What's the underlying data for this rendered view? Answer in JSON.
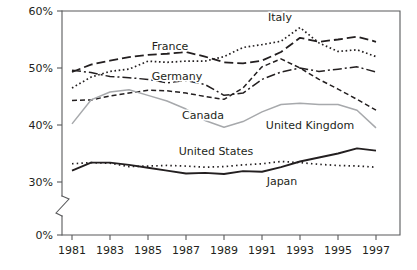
{
  "chart_data": {
    "type": "line",
    "title": "",
    "subtitle": "",
    "xlabel": "",
    "ylabel": "",
    "x": [
      1981,
      1982,
      1983,
      1984,
      1985,
      1986,
      1987,
      1988,
      1989,
      1990,
      1991,
      1992,
      1993,
      1994,
      1995,
      1996,
      1997
    ],
    "xlim": [
      1981,
      1997
    ],
    "ylim": [
      28,
      60
    ],
    "y_tick_labels": [
      "0%",
      "30%",
      "40%",
      "50%",
      "60%"
    ],
    "y_tick_values": [
      0,
      30,
      40,
      50,
      60
    ],
    "x_tick_labels": [
      "1981",
      "1983",
      "1985",
      "1987",
      "1989",
      "1991",
      "1993",
      "1995",
      "1997"
    ],
    "x_tick_values": [
      1981,
      1983,
      1985,
      1987,
      1989,
      1991,
      1993,
      1995,
      1997
    ],
    "grid": false,
    "legend_position": "inline-labels",
    "y_axis_break": true,
    "series": [
      {
        "name": "France",
        "label": "France",
        "style": "long-dash",
        "color": "#231f20",
        "values": [
          49.3,
          50.6,
          51.3,
          51.9,
          52.3,
          52.5,
          52.8,
          52.0,
          51.0,
          50.8,
          51.3,
          52.8,
          55.3,
          54.6,
          55.0,
          55.5,
          54.6
        ]
      },
      {
        "name": "Italy",
        "label": "Italy",
        "style": "dotted",
        "color": "#231f20",
        "values": [
          46.5,
          48.4,
          49.4,
          49.8,
          51.2,
          51.0,
          51.2,
          51.2,
          52.0,
          53.6,
          54.1,
          54.7,
          57.1,
          54.4,
          52.9,
          53.2,
          52.0
        ]
      },
      {
        "name": "Germany",
        "label": "Germany",
        "style": "dash-dot",
        "color": "#231f20",
        "values": [
          49.6,
          49.2,
          48.5,
          48.3,
          48.0,
          47.4,
          47.8,
          47.1,
          45.2,
          45.6,
          48.0,
          49.3,
          50.0,
          49.4,
          49.8,
          50.2,
          49.3
        ]
      },
      {
        "name": "Canada",
        "label": "Canada",
        "style": "short-dash",
        "color": "#231f20",
        "values": [
          44.3,
          44.4,
          45.1,
          45.6,
          46.1,
          46.0,
          45.6,
          45.0,
          44.5,
          46.5,
          50.2,
          51.6,
          50.0,
          48.0,
          46.3,
          44.5,
          42.6
        ]
      },
      {
        "name": "United Kingdom",
        "label": "United Kingdom",
        "style": "solid-gray",
        "color": "#a7a9ac",
        "values": [
          40.2,
          44.4,
          45.8,
          46.2,
          45.2,
          44.2,
          42.8,
          40.8,
          39.6,
          40.6,
          42.3,
          43.6,
          43.8,
          43.6,
          43.6,
          42.6,
          39.5
        ]
      },
      {
        "name": "Japan",
        "label": "Japan",
        "style": "solid-black",
        "color": "#231f20",
        "values": [
          32.0,
          33.4,
          33.4,
          33.0,
          32.5,
          32.0,
          31.5,
          31.6,
          31.4,
          31.9,
          31.8,
          32.6,
          33.6,
          34.3,
          35.0,
          35.9,
          35.5
        ]
      },
      {
        "name": "United States",
        "label": "United States",
        "style": "fine-dotted",
        "color": "#231f20",
        "values": [
          33.2,
          33.4,
          33.3,
          32.7,
          32.8,
          32.9,
          32.8,
          32.6,
          32.7,
          33.0,
          33.2,
          33.6,
          33.4,
          33.1,
          32.9,
          32.8,
          32.6
        ]
      }
    ],
    "inline_labels": [
      {
        "text": "France",
        "x": 170,
        "y": 50
      },
      {
        "text": "Italy",
        "x": 280,
        "y": 21
      },
      {
        "text": "Germany",
        "x": 177,
        "y": 80
      },
      {
        "text": "Canada",
        "x": 203,
        "y": 119
      },
      {
        "text": "United Kingdom",
        "x": 310,
        "y": 129
      },
      {
        "text": "United States",
        "x": 216,
        "y": 155
      },
      {
        "text": "Japan",
        "x": 282,
        "y": 185
      }
    ]
  }
}
